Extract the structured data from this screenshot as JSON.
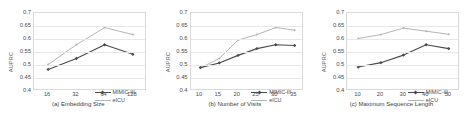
{
  "figure": {
    "ylabel": "AUPRC",
    "ylim": [
      0.4,
      0.7
    ],
    "yticks": [
      0.4,
      0.45,
      0.5,
      0.55,
      0.6,
      0.65,
      0.7
    ],
    "ytick_labels": [
      "0.4",
      "0.45",
      "0.5",
      "0.55",
      "0.6",
      "0.65",
      "0.7"
    ],
    "series_names": [
      "MIMIC-III",
      "eICU"
    ],
    "colors": {
      "mimic": "#4a4a4a",
      "eicu": "#b5b5b5",
      "grid": "#e8e8e8",
      "axis": "#d9d9d9",
      "text": "#4d4d4d"
    },
    "legend_position": "lower right",
    "grid": true
  },
  "legend": {
    "rows": [
      {
        "label": "MIMIC-III",
        "color": "#4a4a4a",
        "marker": true
      },
      {
        "label": "eICU",
        "color": "#b5b5b5",
        "marker": false
      }
    ]
  },
  "chart_data": [
    {
      "type": "line",
      "title": "(a) Embedding Size",
      "xlabel": "(a) Embedding Size",
      "ylabel": "AUPRC",
      "categories": [
        "16",
        "32",
        "64",
        "128"
      ],
      "x": [
        16,
        32,
        64,
        128
      ],
      "ylim": [
        0.4,
        0.7
      ],
      "yticks": [
        0.4,
        0.45,
        0.5,
        0.55,
        0.6,
        0.65,
        0.7
      ],
      "grid": true,
      "legend_position": "lower right",
      "series": [
        {
          "name": "MIMIC-III",
          "color": "#4a4a4a",
          "values": [
            0.483,
            0.525,
            0.578,
            0.541
          ]
        },
        {
          "name": "eICU",
          "color": "#b5b5b5",
          "values": [
            0.502,
            0.578,
            0.644,
            0.617
          ]
        }
      ]
    },
    {
      "type": "line",
      "title": "(b) Number of Visits",
      "xlabel": "(b) Number of Visits",
      "ylabel": "AUPRC",
      "categories": [
        "10",
        "15",
        "20",
        "25",
        "30",
        "35"
      ],
      "x": [
        10,
        15,
        20,
        25,
        30,
        35
      ],
      "ylim": [
        0.4,
        0.7
      ],
      "yticks": [
        0.4,
        0.45,
        0.5,
        0.55,
        0.6,
        0.65,
        0.7
      ],
      "grid": true,
      "legend_position": "lower right",
      "series": [
        {
          "name": "MIMIC-III",
          "color": "#4a4a4a",
          "values": [
            0.49,
            0.508,
            0.537,
            0.563,
            0.578,
            0.575
          ]
        },
        {
          "name": "eICU",
          "color": "#b5b5b5",
          "values": [
            0.489,
            0.525,
            0.596,
            0.617,
            0.644,
            0.634
          ]
        }
      ]
    },
    {
      "type": "line",
      "title": "(c) Maximum Sequence Length",
      "xlabel": "(c) Maximum Sequence Length",
      "ylabel": "AUPRC",
      "categories": [
        "10",
        "20",
        "30",
        "40",
        "50"
      ],
      "x": [
        10,
        20,
        30,
        40,
        50
      ],
      "ylim": [
        0.4,
        0.7
      ],
      "yticks": [
        0.4,
        0.45,
        0.5,
        0.55,
        0.6,
        0.65,
        0.7
      ],
      "grid": true,
      "legend_position": "lower right",
      "series": [
        {
          "name": "MIMIC-III",
          "color": "#4a4a4a",
          "values": [
            0.492,
            0.509,
            0.538,
            0.578,
            0.563
          ]
        },
        {
          "name": "eICU",
          "color": "#b5b5b5",
          "values": [
            0.602,
            0.617,
            0.642,
            0.63,
            0.618
          ]
        }
      ]
    }
  ]
}
